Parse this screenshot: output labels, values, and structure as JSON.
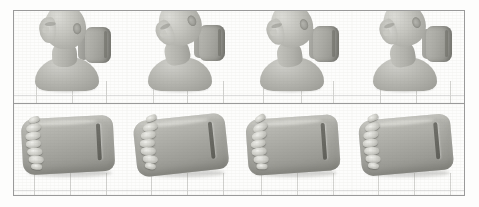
{
  "figure": {
    "type": "simulation-frame-grid",
    "rows": 2,
    "columns": 4,
    "frame_border_color": "#9a9a9a",
    "background_color": "#fdfdfc",
    "render_material_color": "#b4b4ae",
    "bone_material_color": "#e2e2dd",
    "groove_color": "#6f6f69",
    "grid_line_color": "#d3d3d0"
  },
  "rows": [
    {
      "id": "row-head",
      "name": "head-and-torso-row",
      "description": "Rendered human head, neck and upper torso model contacting a vehicle head restraint, shown at four successive simulation time steps.",
      "panels": [
        {
          "id": "panel-head-1",
          "name": "head-frame-1",
          "index": 1,
          "posture": "neutral upright",
          "head_rotation_deg": 0,
          "contact": "no contact"
        },
        {
          "id": "panel-head-2",
          "name": "head-frame-2",
          "index": 2,
          "posture": "rearward extension",
          "head_rotation_deg": 18,
          "contact": "initial contact"
        },
        {
          "id": "panel-head-3",
          "name": "head-frame-3",
          "index": 3,
          "posture": "peak extension",
          "head_rotation_deg": 12,
          "contact": "loaded"
        },
        {
          "id": "panel-head-4",
          "name": "head-frame-4",
          "index": 4,
          "posture": "rebound",
          "head_rotation_deg": 15,
          "contact": "rebound"
        }
      ]
    },
    {
      "id": "row-spine",
      "name": "head-restraint-and-cervical-spine-row",
      "description": "Head restraint cushion with the cervical vertebral column exposed at the same four simulation time steps.",
      "panels": [
        {
          "id": "panel-spine-1",
          "name": "spine-frame-1",
          "index": 1,
          "vertebra_count": 7,
          "spine_curvature": "lordotic neutral"
        },
        {
          "id": "panel-spine-2",
          "name": "spine-frame-2",
          "index": 2,
          "vertebra_count": 7,
          "spine_curvature": "extension s-shape"
        },
        {
          "id": "panel-spine-3",
          "name": "spine-frame-3",
          "index": 3,
          "vertebra_count": 7,
          "spine_curvature": "maximum extension"
        },
        {
          "id": "panel-spine-4",
          "name": "spine-frame-4",
          "index": 4,
          "vertebra_count": 7,
          "spine_curvature": "returning"
        }
      ]
    }
  ]
}
